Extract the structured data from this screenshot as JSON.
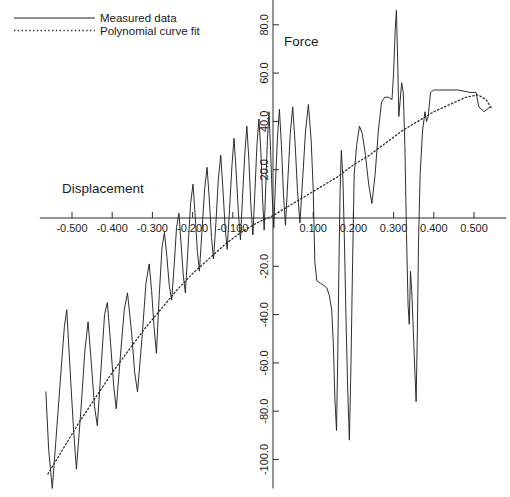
{
  "figure": {
    "name": "force-displacement-plot"
  },
  "legend": {
    "position": "top-left",
    "items": [
      {
        "label": "Measured data",
        "style": "solid",
        "icon": "solid-line-swatch"
      },
      {
        "label": "Polynomial curve fit",
        "style": "dotted",
        "icon": "dotted-line-swatch"
      }
    ]
  },
  "chart_data": {
    "type": "line",
    "title": "",
    "subtitle": "",
    "xlabel": "Displacement",
    "ylabel": "Force",
    "xlim": [
      -0.58,
      0.58
    ],
    "ylim": [
      -112,
      92
    ],
    "grid": false,
    "legend_position": "top-left",
    "x_ticks": [
      -0.5,
      -0.4,
      -0.3,
      -0.2,
      -0.1,
      0.1,
      0.2,
      0.3,
      0.4,
      0.5
    ],
    "x_tick_labels": [
      "-0.500",
      "-0.400",
      "-0.300",
      "-0.200",
      "-0.100",
      "0.100",
      "0.200",
      "0.300",
      "0.400",
      "0.500"
    ],
    "y_ticks": [
      80.0,
      60.0,
      40.0,
      20.0,
      -20.0,
      -40.0,
      -60.0,
      -80.0,
      -100.0
    ],
    "y_tick_labels": [
      "80.0",
      "60.0",
      "40.0",
      "20.0",
      "-20.0",
      "-40.0",
      "-60.0",
      "-80.0",
      "-100.0"
    ],
    "y_axis_position": "center-at-x-zero",
    "x_axis_position": "center-at-y-zero",
    "series": [
      {
        "name": "Measured data",
        "style": "solid",
        "points": [
          [
            -0.565,
            -72
          ],
          [
            -0.558,
            -96
          ],
          [
            -0.549,
            -112
          ],
          [
            -0.54,
            -92
          ],
          [
            -0.528,
            -65
          ],
          [
            -0.519,
            -45
          ],
          [
            -0.513,
            -38
          ],
          [
            -0.503,
            -68
          ],
          [
            -0.496,
            -88
          ],
          [
            -0.489,
            -104
          ],
          [
            -0.478,
            -80
          ],
          [
            -0.468,
            -55
          ],
          [
            -0.46,
            -43
          ],
          [
            -0.452,
            -60
          ],
          [
            -0.444,
            -78
          ],
          [
            -0.437,
            -86
          ],
          [
            -0.428,
            -63
          ],
          [
            -0.419,
            -40
          ],
          [
            -0.412,
            -35
          ],
          [
            -0.404,
            -52
          ],
          [
            -0.396,
            -70
          ],
          [
            -0.39,
            -79
          ],
          [
            -0.38,
            -58
          ],
          [
            -0.37,
            -38
          ],
          [
            -0.362,
            -31
          ],
          [
            -0.352,
            -47
          ],
          [
            -0.344,
            -64
          ],
          [
            -0.337,
            -72
          ],
          [
            -0.326,
            -50
          ],
          [
            -0.316,
            -27
          ],
          [
            -0.308,
            -19
          ],
          [
            -0.302,
            -30
          ],
          [
            -0.296,
            -45
          ],
          [
            -0.29,
            -56
          ],
          [
            -0.283,
            -32
          ],
          [
            -0.276,
            -12
          ],
          [
            -0.27,
            -6
          ],
          [
            -0.264,
            -16
          ],
          [
            -0.258,
            -28
          ],
          [
            -0.252,
            -34
          ],
          [
            -0.246,
            -20
          ],
          [
            -0.24,
            -4
          ],
          [
            -0.234,
            2
          ],
          [
            -0.229,
            -10
          ],
          [
            -0.223,
            -24
          ],
          [
            -0.218,
            -31
          ],
          [
            -0.212,
            -14
          ],
          [
            -0.205,
            6
          ],
          [
            -0.199,
            14
          ],
          [
            -0.194,
            2
          ],
          [
            -0.188,
            -14
          ],
          [
            -0.183,
            -22
          ],
          [
            -0.177,
            -6
          ],
          [
            -0.17,
            12
          ],
          [
            -0.164,
            21
          ],
          [
            -0.159,
            9
          ],
          [
            -0.153,
            -8
          ],
          [
            -0.148,
            -17
          ],
          [
            -0.142,
            -2
          ],
          [
            -0.136,
            16
          ],
          [
            -0.13,
            26
          ],
          [
            -0.125,
            13
          ],
          [
            -0.119,
            -4
          ],
          [
            -0.114,
            -13
          ],
          [
            -0.108,
            4
          ],
          [
            -0.102,
            22
          ],
          [
            -0.097,
            33
          ],
          [
            -0.092,
            20
          ],
          [
            -0.086,
            2
          ],
          [
            -0.081,
            -9
          ],
          [
            -0.076,
            8
          ],
          [
            -0.07,
            27
          ],
          [
            -0.065,
            38
          ],
          [
            -0.06,
            24
          ],
          [
            -0.055,
            5
          ],
          [
            -0.05,
            -7
          ],
          [
            -0.045,
            11
          ],
          [
            -0.04,
            30
          ],
          [
            -0.035,
            41
          ],
          [
            -0.03,
            27
          ],
          [
            -0.026,
            8
          ],
          [
            -0.022,
            -5
          ],
          [
            -0.018,
            13
          ],
          [
            -0.014,
            32
          ],
          [
            -0.01,
            44
          ],
          [
            -0.006,
            28
          ],
          [
            -0.002,
            9
          ],
          [
            0.002,
            -4
          ],
          [
            0.006,
            14
          ],
          [
            0.011,
            33
          ],
          [
            0.016,
            45
          ],
          [
            0.021,
            30
          ],
          [
            0.026,
            10
          ],
          [
            0.031,
            -3
          ],
          [
            0.037,
            16
          ],
          [
            0.043,
            35
          ],
          [
            0.049,
            46
          ],
          [
            0.055,
            31
          ],
          [
            0.061,
            11
          ],
          [
            0.067,
            -2
          ],
          [
            0.074,
            17
          ],
          [
            0.081,
            36
          ],
          [
            0.088,
            47
          ],
          [
            0.095,
            32
          ],
          [
            0.1,
            12
          ],
          [
            0.104,
            -18
          ],
          [
            0.109,
            -26
          ],
          [
            0.118,
            -27
          ],
          [
            0.127,
            -28
          ],
          [
            0.134,
            -29
          ],
          [
            0.14,
            -32
          ],
          [
            0.146,
            -38
          ],
          [
            0.15,
            -52
          ],
          [
            0.154,
            -75
          ],
          [
            0.158,
            -88
          ],
          [
            0.161,
            -58
          ],
          [
            0.164,
            -20
          ],
          [
            0.167,
            12
          ],
          [
            0.17,
            28
          ],
          [
            0.174,
            16
          ],
          [
            0.178,
            -12
          ],
          [
            0.182,
            -45
          ],
          [
            0.186,
            -72
          ],
          [
            0.19,
            -92
          ],
          [
            0.194,
            -60
          ],
          [
            0.198,
            -18
          ],
          [
            0.202,
            18
          ],
          [
            0.208,
            30
          ],
          [
            0.215,
            38
          ],
          [
            0.222,
            35
          ],
          [
            0.23,
            26
          ],
          [
            0.238,
            14
          ],
          [
            0.246,
            6
          ],
          [
            0.254,
            18
          ],
          [
            0.262,
            36
          ],
          [
            0.27,
            48
          ],
          [
            0.278,
            50
          ],
          [
            0.288,
            50
          ],
          [
            0.296,
            49
          ],
          [
            0.3,
            60
          ],
          [
            0.304,
            78
          ],
          [
            0.307,
            86
          ],
          [
            0.31,
            66
          ],
          [
            0.313,
            42
          ],
          [
            0.316,
            48
          ],
          [
            0.32,
            56
          ],
          [
            0.324,
            52
          ],
          [
            0.328,
            30
          ],
          [
            0.332,
            -6
          ],
          [
            0.336,
            -36
          ],
          [
            0.339,
            -44
          ],
          [
            0.342,
            -22
          ],
          [
            0.345,
            -30
          ],
          [
            0.348,
            -42
          ],
          [
            0.352,
            -60
          ],
          [
            0.356,
            -76
          ],
          [
            0.359,
            -48
          ],
          [
            0.362,
            -10
          ],
          [
            0.366,
            18
          ],
          [
            0.372,
            36
          ],
          [
            0.378,
            44
          ],
          [
            0.382,
            40
          ],
          [
            0.386,
            42
          ],
          [
            0.392,
            52
          ],
          [
            0.4,
            53
          ],
          [
            0.43,
            53
          ],
          [
            0.46,
            53
          ],
          [
            0.49,
            52
          ],
          [
            0.505,
            52
          ],
          [
            0.512,
            46
          ],
          [
            0.525,
            44
          ],
          [
            0.54,
            46
          ]
        ]
      },
      {
        "name": "Polynomial curve fit",
        "style": "dotted",
        "points": [
          [
            -0.56,
            -106
          ],
          [
            -0.52,
            -95
          ],
          [
            -0.48,
            -84
          ],
          [
            -0.44,
            -74
          ],
          [
            -0.4,
            -64
          ],
          [
            -0.36,
            -55
          ],
          [
            -0.32,
            -46
          ],
          [
            -0.28,
            -38
          ],
          [
            -0.24,
            -30
          ],
          [
            -0.2,
            -23
          ],
          [
            -0.16,
            -17
          ],
          [
            -0.12,
            -11
          ],
          [
            -0.08,
            -6
          ],
          [
            -0.04,
            -2
          ],
          [
            0.0,
            1
          ],
          [
            0.04,
            5
          ],
          [
            0.08,
            9
          ],
          [
            0.12,
            13
          ],
          [
            0.16,
            17
          ],
          [
            0.2,
            22
          ],
          [
            0.24,
            26
          ],
          [
            0.28,
            31
          ],
          [
            0.32,
            36
          ],
          [
            0.36,
            40
          ],
          [
            0.4,
            44
          ],
          [
            0.44,
            47
          ],
          [
            0.48,
            50
          ],
          [
            0.51,
            51
          ],
          [
            0.53,
            49
          ],
          [
            0.545,
            45
          ]
        ]
      }
    ]
  }
}
